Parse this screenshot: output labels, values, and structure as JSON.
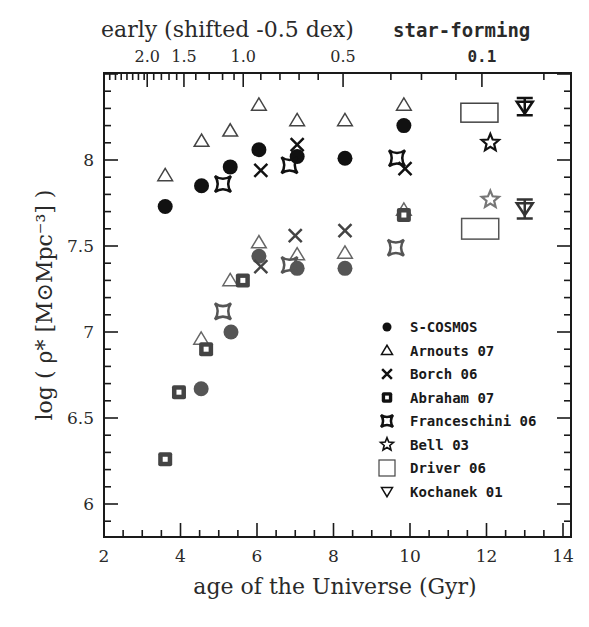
{
  "chart_data": {
    "type": "scatter",
    "title": "",
    "xlabel": "age of the Universe (Gyr)",
    "ylabel": "log ( ρ* [M⊙Mpc⁻³] )",
    "xlim": [
      2,
      14.2
    ],
    "ylim": [
      5.82,
      8.52
    ],
    "x_ticks": [
      2,
      4,
      6,
      8,
      10,
      12,
      14
    ],
    "y_ticks": [
      6,
      6.5,
      7,
      7.5,
      8
    ],
    "top_axis": {
      "label_left": "early (shifted -0.5 dex)",
      "label_right": "star-forming",
      "type": "redshift",
      "ticks": [
        {
          "label": "2.0",
          "age": 3.13
        },
        {
          "label": "1.5",
          "age": 4.09
        },
        {
          "label": "1.0",
          "age": 5.64
        },
        {
          "label": "0.5",
          "age": 8.25
        },
        {
          "label": "0.1",
          "age": 11.88
        }
      ]
    },
    "grid": false,
    "legend_position": "lower right inside",
    "series": [
      {
        "name": "S-COSMOS",
        "marker": "filled-circle",
        "group": "star-forming",
        "color": "#111111",
        "points": [
          [
            3.6,
            7.73
          ],
          [
            4.55,
            7.85
          ],
          [
            5.3,
            7.96
          ],
          [
            6.05,
            8.06
          ],
          [
            7.05,
            8.02
          ],
          [
            8.3,
            8.01
          ],
          [
            9.84,
            8.2
          ]
        ]
      },
      {
        "name": "S-COSMOS",
        "marker": "filled-circle",
        "group": "early",
        "color": "#555555",
        "points": [
          [
            4.54,
            6.67
          ],
          [
            5.32,
            7.0
          ],
          [
            6.05,
            7.44
          ],
          [
            7.05,
            7.37
          ],
          [
            8.3,
            7.37
          ]
        ]
      },
      {
        "name": "Arnouts 07",
        "marker": "open-triangle",
        "group": "star-forming",
        "color": "#444444",
        "points": [
          [
            3.6,
            7.91
          ],
          [
            4.55,
            8.11
          ],
          [
            5.3,
            8.17
          ],
          [
            6.05,
            8.32
          ],
          [
            7.05,
            8.23
          ],
          [
            8.3,
            8.23
          ],
          [
            9.84,
            8.32
          ]
        ]
      },
      {
        "name": "Arnouts 07",
        "marker": "open-triangle",
        "group": "early",
        "color": "#666666",
        "points": [
          [
            4.54,
            6.96
          ],
          [
            5.3,
            7.3
          ],
          [
            6.05,
            7.52
          ],
          [
            7.05,
            7.45
          ],
          [
            8.3,
            7.46
          ],
          [
            9.84,
            7.71
          ]
        ]
      },
      {
        "name": "Borch 06",
        "marker": "cross",
        "group": "star-forming",
        "color": "#111111",
        "points": [
          [
            6.1,
            7.94
          ],
          [
            7.05,
            8.09
          ],
          [
            9.87,
            7.95
          ]
        ]
      },
      {
        "name": "Borch 06",
        "marker": "cross",
        "group": "early",
        "color": "#444444",
        "points": [
          [
            6.1,
            7.38
          ],
          [
            7.0,
            7.56
          ],
          [
            8.3,
            7.59
          ]
        ]
      },
      {
        "name": "Abraham 07",
        "marker": "filled-square-hollow",
        "group": "early",
        "color": "#444444",
        "points": [
          [
            3.6,
            6.26
          ],
          [
            3.96,
            6.65
          ],
          [
            4.67,
            6.9
          ],
          [
            5.63,
            7.3
          ],
          [
            9.84,
            7.68
          ]
        ]
      },
      {
        "name": "Franceschini 06",
        "marker": "four-point-star",
        "group": "star-forming",
        "color": "#111111",
        "points": [
          [
            5.11,
            7.86
          ],
          [
            6.85,
            7.97
          ],
          [
            9.66,
            8.01
          ]
        ]
      },
      {
        "name": "Franceschini 06",
        "marker": "four-point-star",
        "group": "early",
        "color": "#555555",
        "points": [
          [
            5.11,
            7.12
          ],
          [
            6.85,
            7.39
          ],
          [
            9.63,
            7.49
          ]
        ]
      },
      {
        "name": "Bell 03",
        "marker": "open-star",
        "group": "star-forming",
        "color": "#111111",
        "points": [
          [
            12.1,
            8.1
          ]
        ]
      },
      {
        "name": "Bell 03",
        "marker": "open-star",
        "group": "early",
        "color": "#777777",
        "points": [
          [
            12.1,
            7.77
          ]
        ]
      },
      {
        "name": "Driver 06",
        "marker": "open-rectangle",
        "group": "star-forming",
        "color": "#444444",
        "boxes": [
          {
            "x0": 11.33,
            "x1": 12.3,
            "y0": 8.22,
            "y1": 8.33
          }
        ]
      },
      {
        "name": "Driver 06",
        "marker": "open-rectangle",
        "group": "early",
        "color": "#555555",
        "boxes": [
          {
            "x0": 11.35,
            "x1": 12.32,
            "y0": 7.54,
            "y1": 7.66
          }
        ]
      },
      {
        "name": "Kochanek 01",
        "marker": "open-down-triangle-errbar",
        "group": "star-forming",
        "color": "#111111",
        "points": [
          [
            13.0,
            8.31
          ]
        ],
        "err": [
          [
            8.26,
            8.36
          ]
        ]
      },
      {
        "name": "Kochanek 01",
        "marker": "open-down-triangle-errbar",
        "group": "early",
        "color": "#333333",
        "points": [
          [
            13.0,
            7.72
          ]
        ],
        "err": [
          [
            7.66,
            7.77
          ]
        ]
      }
    ],
    "legend": [
      "S-COSMOS",
      "Arnouts 07",
      "Borch 06",
      "Abraham 07",
      "Franceschini 06",
      "Bell 03",
      "Driver 06",
      "Kochanek 01"
    ]
  }
}
